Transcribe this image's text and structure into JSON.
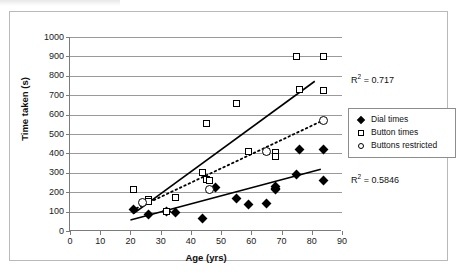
{
  "chart_data": {
    "type": "scatter",
    "title": "",
    "xlabel": "Age (yrs)",
    "ylabel": "Time taken (s)",
    "xlim": [
      0,
      90
    ],
    "ylim": [
      0,
      1000
    ],
    "xticks": [
      0,
      10,
      20,
      30,
      40,
      50,
      60,
      70,
      80,
      90
    ],
    "yticks": [
      0,
      100,
      200,
      300,
      400,
      500,
      600,
      700,
      800,
      900,
      1000
    ],
    "grid": "horizontal",
    "legend_position": "right",
    "series": [
      {
        "name": "Dial times",
        "marker": "filled-diamond",
        "color": "#000000",
        "points": [
          [
            21,
            110
          ],
          [
            26,
            83
          ],
          [
            32,
            103
          ],
          [
            35,
            96
          ],
          [
            44,
            64
          ],
          [
            48,
            223
          ],
          [
            55,
            166
          ],
          [
            59,
            135
          ],
          [
            65,
            141
          ],
          [
            68,
            228
          ],
          [
            68,
            213
          ],
          [
            68,
            218
          ],
          [
            75,
            289
          ],
          [
            76,
            421
          ],
          [
            84,
            422
          ],
          [
            84,
            258
          ]
        ]
      },
      {
        "name": "Button times",
        "marker": "open-square",
        "color": "#000000",
        "points": [
          [
            21,
            212
          ],
          [
            26,
            163
          ],
          [
            26,
            151
          ],
          [
            32,
            103
          ],
          [
            35,
            173
          ],
          [
            44,
            299
          ],
          [
            45,
            553
          ],
          [
            45,
            266
          ],
          [
            46,
            258
          ],
          [
            55,
            655
          ],
          [
            59,
            409
          ],
          [
            65,
            411
          ],
          [
            68,
            405
          ],
          [
            68,
            386
          ],
          [
            75,
            897
          ],
          [
            76,
            731
          ],
          [
            84,
            897
          ],
          [
            84,
            723
          ]
        ]
      },
      {
        "name": "Buttons restricted",
        "marker": "open-circle",
        "color": "#000000",
        "points": [
          [
            24,
            147
          ],
          [
            46,
            216
          ],
          [
            65,
            412
          ],
          [
            84,
            572
          ]
        ]
      }
    ],
    "trendlines": [
      {
        "name": "Button times trend",
        "style": "solid",
        "series": "Button times",
        "r_squared": "0.717",
        "r_squared_label": "R2 = 0.717",
        "x_start": 21,
        "y_start": 90,
        "x_end": 81,
        "y_end": 772
      },
      {
        "name": "Buttons restricted trend",
        "style": "dotted",
        "series": "Buttons restricted",
        "r_squared": "",
        "r_squared_label": "",
        "x_start": 22,
        "y_start": 117,
        "x_end": 84,
        "y_end": 572
      },
      {
        "name": "Dial times trend",
        "style": "solid",
        "series": "Dial times",
        "r_squared": "0.5846",
        "r_squared_label": "R2 = 0.5846",
        "x_start": 20,
        "y_start": 57,
        "x_end": 83,
        "y_end": 318
      }
    ]
  },
  "axes": {
    "y_title": "Time taken (s)",
    "x_title": "Age (yrs)",
    "y_tick_labels": [
      "1000",
      "900",
      "800",
      "700",
      "600",
      "500",
      "400",
      "300",
      "200",
      "100",
      "0"
    ],
    "x_tick_labels": [
      "0",
      "10",
      "20",
      "30",
      "40",
      "50",
      "60",
      "70",
      "80",
      "90"
    ]
  },
  "legend": {
    "items": [
      {
        "label": "Dial times",
        "marker": "filled-diamond"
      },
      {
        "label": "Button times",
        "marker": "open-square"
      },
      {
        "label": "Buttons restricted",
        "marker": "open-circle"
      }
    ]
  },
  "annotations": {
    "r2_upper_prefix": "R",
    "r2_upper_sup": "2",
    "r2_upper_value": " = 0.717",
    "r2_lower_prefix": "R",
    "r2_lower_sup": "2",
    "r2_lower_value": " = 0.5846"
  }
}
